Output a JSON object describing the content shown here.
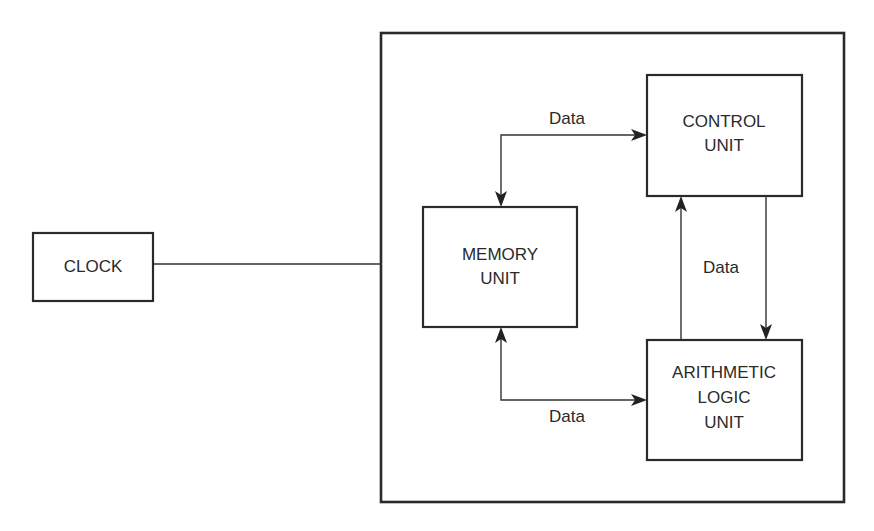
{
  "diagram": {
    "title": "",
    "nodes": {
      "clock": {
        "lines": [
          "CLOCK"
        ]
      },
      "memory": {
        "lines": [
          "MEMORY",
          "UNIT"
        ]
      },
      "control": {
        "lines": [
          "CONTROL",
          "UNIT"
        ]
      },
      "alu": {
        "lines": [
          "ARITHMETIC",
          "LOGIC",
          "UNIT"
        ]
      }
    },
    "edges": {
      "clock_to_cpu": {
        "label": "",
        "from": "clock",
        "to": "cpu-enclosure",
        "directed": false
      },
      "memory_control": {
        "label": "Data",
        "from": "memory",
        "to": "control",
        "directed": "both"
      },
      "memory_alu": {
        "label": "Data",
        "from": "memory",
        "to": "alu",
        "directed": "both"
      },
      "control_alu": {
        "label": "Data",
        "from": "control",
        "to": "alu",
        "directed": "both"
      }
    },
    "colors": {
      "stroke": "#2a2a2a",
      "background": "#ffffff"
    }
  }
}
